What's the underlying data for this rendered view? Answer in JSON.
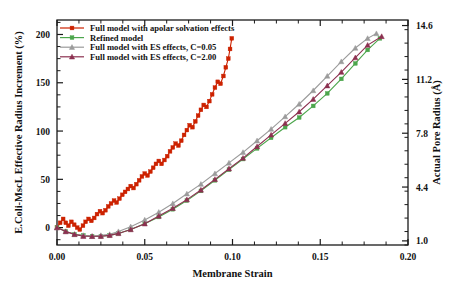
{
  "chart_data": {
    "type": "line",
    "title": "",
    "xlabel": "Membrane Strain",
    "ylabel": "E.Coli-MscL Effective Radius Increment (%)",
    "y2label": "Actual Pore Radius (Å)",
    "xlim": [
      0.0,
      0.2
    ],
    "ylim": [
      -18,
      215
    ],
    "y2lim": [
      0.74,
      14.95
    ],
    "xticks": [
      "0.00",
      "0.05",
      "0.10",
      "0.15",
      "0.20"
    ],
    "xtick_values": [
      0.0,
      0.05,
      0.1,
      0.15,
      0.2
    ],
    "yticks": [
      "0",
      "50",
      "100",
      "150",
      "200"
    ],
    "ytick_values": [
      0,
      50,
      100,
      150,
      200
    ],
    "y2ticks": [
      "1.0",
      "4.4",
      "7.8",
      "11.2",
      "14.6"
    ],
    "y2tick_values": [
      1.0,
      4.4,
      7.8,
      11.2,
      14.6
    ],
    "grid": false,
    "legend_position": "top-left",
    "minor_ticks": true,
    "series": [
      {
        "name": "Full model with apolar solvation effects",
        "color": "#CC2200",
        "marker": "square",
        "points": [
          [
            0.0,
            0
          ],
          [
            0.0018,
            5
          ],
          [
            0.0035,
            9
          ],
          [
            0.005,
            5
          ],
          [
            0.0065,
            2
          ],
          [
            0.0082,
            6
          ],
          [
            0.0098,
            3
          ],
          [
            0.0115,
            0
          ],
          [
            0.013,
            -2
          ],
          [
            0.0148,
            2
          ],
          [
            0.0163,
            6
          ],
          [
            0.018,
            9
          ],
          [
            0.0196,
            7
          ],
          [
            0.0212,
            10
          ],
          [
            0.0228,
            14
          ],
          [
            0.0245,
            17
          ],
          [
            0.026,
            15
          ],
          [
            0.0276,
            18
          ],
          [
            0.0292,
            22
          ],
          [
            0.0308,
            25
          ],
          [
            0.0325,
            28
          ],
          [
            0.034,
            26
          ],
          [
            0.0356,
            30
          ],
          [
            0.0372,
            34
          ],
          [
            0.0388,
            37
          ],
          [
            0.0404,
            40
          ],
          [
            0.042,
            43
          ],
          [
            0.0436,
            41
          ],
          [
            0.0452,
            45
          ],
          [
            0.0468,
            49
          ],
          [
            0.0484,
            53
          ],
          [
            0.05,
            56
          ],
          [
            0.0516,
            54
          ],
          [
            0.0532,
            58
          ],
          [
            0.0548,
            62
          ],
          [
            0.0564,
            66
          ],
          [
            0.058,
            69
          ],
          [
            0.0596,
            66
          ],
          [
            0.0612,
            70
          ],
          [
            0.0628,
            74
          ],
          [
            0.0644,
            79
          ],
          [
            0.066,
            83
          ],
          [
            0.0676,
            87
          ],
          [
            0.0692,
            85
          ],
          [
            0.0708,
            90
          ],
          [
            0.0724,
            96
          ],
          [
            0.074,
            101
          ],
          [
            0.0756,
            106
          ],
          [
            0.0772,
            104
          ],
          [
            0.0788,
            110
          ],
          [
            0.0804,
            116
          ],
          [
            0.082,
            122
          ],
          [
            0.0836,
            127
          ],
          [
            0.0852,
            125
          ],
          [
            0.0868,
            131
          ],
          [
            0.0884,
            138
          ],
          [
            0.09,
            145
          ],
          [
            0.0916,
            151
          ],
          [
            0.0932,
            149
          ],
          [
            0.0948,
            157
          ],
          [
            0.0962,
            166
          ],
          [
            0.0976,
            175
          ],
          [
            0.0986,
            185
          ],
          [
            0.0996,
            196
          ]
        ]
      },
      {
        "name": "Refined model",
        "color": "#4CA64C",
        "marker": "square",
        "points": [
          [
            0.0,
            0
          ],
          [
            0.005,
            -4
          ],
          [
            0.01,
            -7
          ],
          [
            0.015,
            -8
          ],
          [
            0.02,
            -9
          ],
          [
            0.025,
            -9
          ],
          [
            0.03,
            -8
          ],
          [
            0.035,
            -6
          ],
          [
            0.042,
            -2
          ],
          [
            0.05,
            4
          ],
          [
            0.058,
            11
          ],
          [
            0.066,
            19
          ],
          [
            0.074,
            28
          ],
          [
            0.082,
            38
          ],
          [
            0.09,
            49
          ],
          [
            0.098,
            60
          ],
          [
            0.106,
            71
          ],
          [
            0.114,
            82
          ],
          [
            0.122,
            93
          ],
          [
            0.13,
            104
          ],
          [
            0.138,
            114
          ],
          [
            0.146,
            126
          ],
          [
            0.154,
            139
          ],
          [
            0.162,
            154
          ],
          [
            0.17,
            170
          ],
          [
            0.177,
            184
          ],
          [
            0.184,
            196
          ]
        ]
      },
      {
        "name": "Full model with ES effects, C=0.05",
        "color": "#9B9B9B",
        "marker": "triangle",
        "points": [
          [
            0.0,
            0
          ],
          [
            0.005,
            -4
          ],
          [
            0.01,
            -7
          ],
          [
            0.015,
            -8
          ],
          [
            0.02,
            -9
          ],
          [
            0.025,
            -8
          ],
          [
            0.03,
            -7
          ],
          [
            0.035,
            -4
          ],
          [
            0.042,
            1
          ],
          [
            0.05,
            8
          ],
          [
            0.058,
            16
          ],
          [
            0.066,
            25
          ],
          [
            0.074,
            35
          ],
          [
            0.082,
            45
          ],
          [
            0.09,
            56
          ],
          [
            0.098,
            67
          ],
          [
            0.106,
            78
          ],
          [
            0.114,
            90
          ],
          [
            0.122,
            102
          ],
          [
            0.13,
            115
          ],
          [
            0.138,
            128
          ],
          [
            0.146,
            142
          ],
          [
            0.154,
            157
          ],
          [
            0.162,
            172
          ],
          [
            0.17,
            186
          ],
          [
            0.177,
            196
          ],
          [
            0.182,
            201
          ]
        ]
      },
      {
        "name": "Full model with ES effects, C=2.00",
        "color": "#8C3050",
        "marker": "triangle",
        "points": [
          [
            0.0,
            0
          ],
          [
            0.005,
            -4
          ],
          [
            0.01,
            -7
          ],
          [
            0.015,
            -9
          ],
          [
            0.02,
            -9
          ],
          [
            0.025,
            -9
          ],
          [
            0.03,
            -8
          ],
          [
            0.035,
            -6
          ],
          [
            0.042,
            -2
          ],
          [
            0.05,
            4
          ],
          [
            0.058,
            12
          ],
          [
            0.066,
            20
          ],
          [
            0.074,
            29
          ],
          [
            0.082,
            39
          ],
          [
            0.09,
            50
          ],
          [
            0.098,
            61
          ],
          [
            0.106,
            72
          ],
          [
            0.114,
            84
          ],
          [
            0.122,
            96
          ],
          [
            0.13,
            108
          ],
          [
            0.138,
            120
          ],
          [
            0.146,
            133
          ],
          [
            0.154,
            147
          ],
          [
            0.162,
            161
          ],
          [
            0.17,
            176
          ],
          [
            0.177,
            189
          ],
          [
            0.185,
            198
          ]
        ]
      }
    ]
  }
}
